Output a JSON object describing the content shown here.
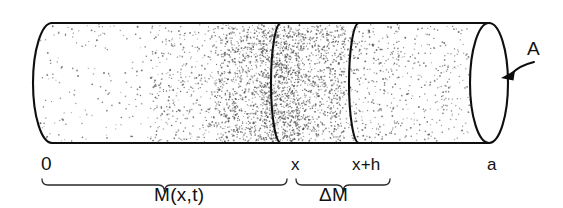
{
  "figure": {
    "kind": "cylinder-mass-balance-diagram",
    "background_color": "#ffffff",
    "ink_color": "#0f0f0f"
  },
  "cylinder": {
    "left_x": 33,
    "right_x": 508,
    "top_y": 23,
    "bottom_y": 143,
    "cap_rx": 19,
    "cap_ry": 60,
    "left_cap_style": "half-ellipse-open-right",
    "right_cap_style": "full-ellipse"
  },
  "dividers": [
    {
      "name": "divider-x",
      "top_x": 281,
      "bulge_x": 271
    },
    {
      "name": "divider-x-plus-h",
      "top_x": 359,
      "bulge_x": 349
    }
  ],
  "stipple": {
    "seed": 20240517,
    "dot_radius": 0.72,
    "dot_color": "#4d4d4d",
    "bands": [
      {
        "x0": 40,
        "x1": 150,
        "count": 150
      },
      {
        "x0": 150,
        "x1": 215,
        "count": 330
      },
      {
        "x0": 215,
        "x1": 260,
        "count": 620
      },
      {
        "x0": 260,
        "x1": 300,
        "count": 980
      },
      {
        "x0": 300,
        "x1": 345,
        "count": 640
      },
      {
        "x0": 345,
        "x1": 400,
        "count": 300
      },
      {
        "x0": 400,
        "x1": 470,
        "count": 230
      }
    ]
  },
  "position_labels": [
    {
      "name": "label-origin",
      "text": "0",
      "x": 41,
      "y": 170,
      "size": "big"
    },
    {
      "name": "label-x",
      "text": "x",
      "x": 291,
      "y": 170,
      "size": "normal"
    },
    {
      "name": "label-x-plus-h",
      "text": "x+h",
      "x": 352,
      "y": 170,
      "size": "normal"
    },
    {
      "name": "label-a",
      "text": "a",
      "x": 487,
      "y": 170,
      "size": "normal"
    }
  ],
  "area_annotation": {
    "name": "label-area-A",
    "text": "A",
    "x": 527,
    "y": 55,
    "arrow": {
      "start_x": 534,
      "start_y": 62,
      "end_x": 501,
      "end_y": 78
    }
  },
  "braces": [
    {
      "name": "brace-total-mass",
      "x0": 42,
      "x1": 287,
      "y": 179,
      "label": "M(x,t)",
      "label_x": 154,
      "label_y": 201
    },
    {
      "name": "brace-delta-mass",
      "x0": 296,
      "x1": 390,
      "y": 179,
      "label": "ΔM",
      "label_x": 319,
      "label_y": 201
    }
  ]
}
